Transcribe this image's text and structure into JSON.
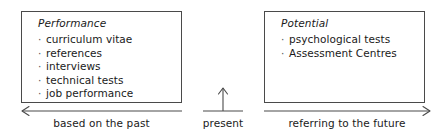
{
  "diagram": {
    "colors": {
      "stroke": "#4a4a4a",
      "text": "#1a1a1a",
      "background": "#ffffff"
    }
  },
  "panels": [
    {
      "id": "performance",
      "title": "Performance",
      "bullet": "·",
      "items": [
        "curriculum vitae",
        "references",
        "interviews",
        "technical tests",
        "job performance"
      ]
    },
    {
      "id": "potential",
      "title": "Potential",
      "bullet": "·",
      "items": [
        "psychological tests",
        "Assessment Centres"
      ]
    }
  ],
  "axis": {
    "past_label": "based on the past",
    "present_label": "present",
    "future_label": "referring to the future"
  }
}
